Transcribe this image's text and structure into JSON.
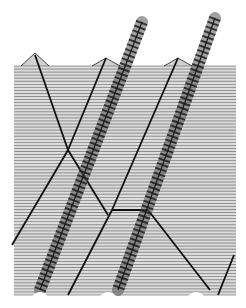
{
  "figure": {
    "kind": "stacked waterfall line plot (soliton interaction)",
    "background": "#ffffff",
    "line_color": "#1a1a1a",
    "fill_color": "#9a9a9a",
    "plot_box": {
      "left": 14,
      "right": 236,
      "top": 66,
      "bottom": 295
    },
    "line_count": 75,
    "peaks": [
      {
        "x": 35,
        "y": 53
      },
      {
        "x": 106,
        "y": 58
      },
      {
        "x": 178,
        "y": 58
      }
    ],
    "spikes": [
      {
        "x": 142,
        "y": 20
      },
      {
        "x": 215,
        "y": 18
      }
    ],
    "dark_tracks": [
      {
        "from": [
          35,
          55
        ],
        "to": [
          68,
          150
        ]
      },
      {
        "from": [
          106,
          58
        ],
        "to": [
          68,
          150
        ]
      },
      {
        "from": [
          68,
          150
        ],
        "to": [
          12,
          245
        ]
      },
      {
        "from": [
          68,
          150
        ],
        "to": [
          108,
          215
        ]
      },
      {
        "from": [
          178,
          58
        ],
        "to": [
          112,
          210
        ]
      },
      {
        "from": [
          112,
          210
        ],
        "to": [
          68,
          295
        ]
      },
      {
        "from": [
          112,
          210
        ],
        "to": [
          148,
          210
        ]
      },
      {
        "from": [
          148,
          210
        ],
        "to": [
          210,
          290
        ]
      },
      {
        "from": [
          234,
          255
        ],
        "to": [
          218,
          295
        ]
      }
    ],
    "ripple_bands": [
      {
        "from": [
          142,
          22
        ],
        "to": [
          40,
          290
        ]
      },
      {
        "from": [
          215,
          18
        ],
        "to": [
          118,
          290
        ]
      }
    ]
  }
}
